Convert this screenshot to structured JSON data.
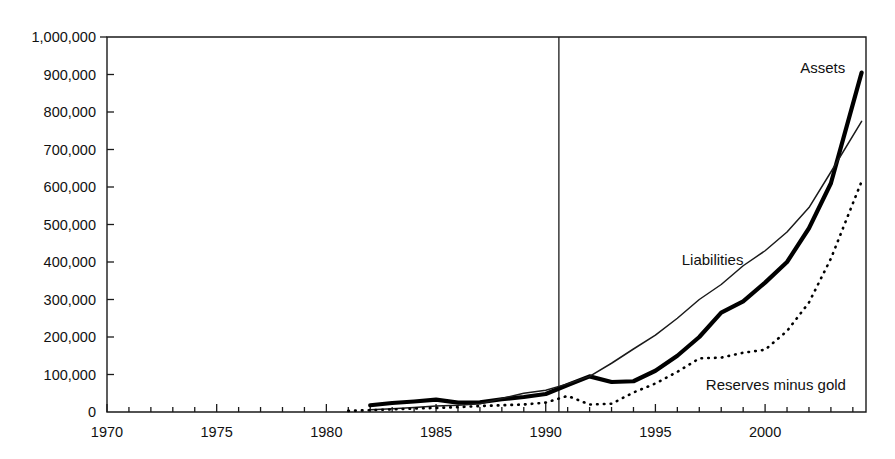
{
  "chart_data": {
    "type": "line",
    "title": "",
    "subtitle": "",
    "xlabel": "",
    "ylabel": "",
    "xlim": [
      1970,
      2004.6
    ],
    "ylim": [
      0,
      1000000
    ],
    "grid": false,
    "legend_position": "inline-annotations",
    "y_ticks": [
      0,
      100000,
      200000,
      300000,
      400000,
      500000,
      600000,
      700000,
      800000,
      900000,
      1000000
    ],
    "y_tick_labels": [
      "0",
      "100,000",
      "200,000",
      "300,000",
      "400,000",
      "500,000",
      "600,000",
      "700,000",
      "800,000",
      "900,000",
      "1,000,000"
    ],
    "x_ticks": [
      1970,
      1975,
      1980,
      1985,
      1990,
      1995,
      2000
    ],
    "x_tick_labels": [
      "1970",
      "1975",
      "1980",
      "1985",
      "1990",
      "1995",
      "2000"
    ],
    "x_minor_tick_step": 1,
    "annotations": [
      {
        "name": "vertical-divider",
        "x": 1990.6,
        "note": ""
      }
    ],
    "series": [
      {
        "name": "Assets",
        "style": "thick-solid",
        "color": "#000000",
        "label_x": 2001.6,
        "label_y": 905000,
        "x": [
          1982,
          1983,
          1984,
          1985,
          1986,
          1987,
          1988,
          1989,
          1990,
          1991,
          1992,
          1993,
          1994,
          1995,
          1996,
          1997,
          1998,
          1999,
          2000,
          2001,
          2002,
          2003,
          2004.4
        ],
        "values": [
          18000,
          24000,
          28000,
          33000,
          25000,
          26000,
          34000,
          40000,
          48000,
          72000,
          95000,
          80000,
          82000,
          110000,
          150000,
          200000,
          265000,
          295000,
          345000,
          400000,
          490000,
          610000,
          905000
        ]
      },
      {
        "name": "Liabilities",
        "style": "thin-solid",
        "color": "#1a1a1a",
        "label_x": 1996.2,
        "label_y": 392000,
        "x": [
          1982,
          1983,
          1984,
          1985,
          1986,
          1987,
          1988,
          1989,
          1990,
          1991,
          1992,
          1993,
          1994,
          1995,
          1996,
          1997,
          1998,
          1999,
          2000,
          2001,
          2002,
          2003,
          2004.4
        ],
        "values": [
          6000,
          9000,
          12000,
          16000,
          18000,
          22000,
          36000,
          50000,
          58000,
          75000,
          95000,
          130000,
          168000,
          205000,
          250000,
          300000,
          340000,
          390000,
          430000,
          480000,
          545000,
          640000,
          775000
        ]
      },
      {
        "name": "Reserves minus gold",
        "style": "dotted",
        "color": "#000000",
        "label_x": 1997.3,
        "label_y": 60000,
        "x": [
          1981,
          1982,
          1983,
          1984,
          1985,
          1986,
          1987,
          1988,
          1989,
          1990,
          1991,
          1992,
          1993,
          1994,
          1995,
          1996,
          1997,
          1998,
          1999,
          2000,
          2001,
          2002,
          2003,
          2004.4
        ],
        "values": [
          3000,
          5000,
          7000,
          9000,
          11000,
          13000,
          16000,
          18000,
          20000,
          25000,
          43000,
          20000,
          22000,
          52000,
          76000,
          107000,
          143000,
          145000,
          158000,
          166000,
          216000,
          292000,
          409000,
          615000
        ]
      }
    ]
  },
  "labels": {
    "assets": "Assets",
    "liabilities": "Liabilities",
    "reserves": "Reserves minus gold"
  }
}
